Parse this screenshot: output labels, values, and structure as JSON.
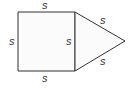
{
  "diagram": {
    "shapes": [
      "square",
      "equilateral-triangle"
    ],
    "labels": {
      "square_top": "s",
      "square_bottom": "s",
      "square_left": "s",
      "shared_side": "s",
      "triangle_upper": "s",
      "triangle_lower": "s"
    },
    "colors": {
      "stroke": "#333333",
      "fill": "#fbfbfb"
    }
  }
}
